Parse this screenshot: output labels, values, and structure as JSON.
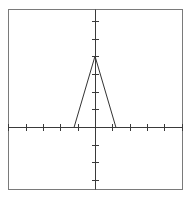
{
  "chart_data": {
    "type": "line",
    "title": "",
    "xlabel": "",
    "ylabel": "",
    "xlim": [
      -5,
      5
    ],
    "ylim": [
      -3.5,
      6.7
    ],
    "x_ticks": [
      -4,
      -3,
      -2,
      -1,
      1,
      2,
      3,
      4
    ],
    "y_ticks": [
      -3,
      -2,
      -1,
      1,
      2,
      3,
      4,
      5,
      6
    ],
    "tick_labels_shown": false,
    "grid": false,
    "legend": null,
    "series": [
      {
        "name": "triangle",
        "x": [
          -1.2,
          0,
          1.2
        ],
        "y": [
          0,
          4,
          0
        ],
        "color": "#333333"
      }
    ]
  },
  "layout": {
    "frame": {
      "left": 8.5,
      "top": 9.5,
      "right": 182.5,
      "bottom": 189.5,
      "color": "#7a7a7a"
    },
    "origin_px": {
      "x": 95,
      "y": 127
    },
    "unit_px": {
      "x": 17.35,
      "y": 17.7
    },
    "tick_half_len": 3
  }
}
